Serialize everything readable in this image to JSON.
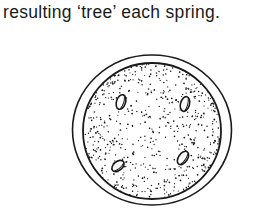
{
  "text": {
    "caption_line": "resulting ‘tree’ each spring."
  },
  "figure": {
    "ink_color": "#1a1a1a",
    "background": "#ffffff"
  }
}
